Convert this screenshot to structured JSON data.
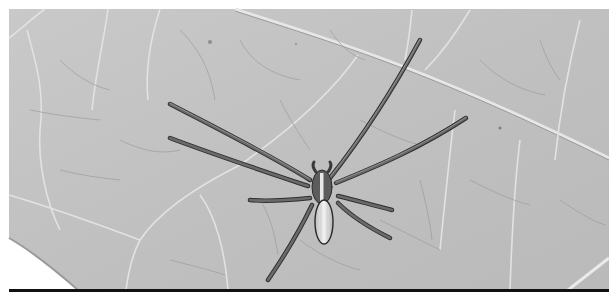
{
  "image": {
    "subject": "spider on a leaf",
    "style": "grayscale photograph",
    "description": "Long-legged spider with striped abdomen resting on the underside of a veined leaf"
  },
  "colors": {
    "background": "#ffffff",
    "leaf": "#c4c4c4",
    "leaf_dark": "#9e9e9e",
    "vein_light": "#e4e4e4",
    "vein_dark": "#8a8a8a",
    "spider_leg": "#5a5a5a",
    "spider_leg_dark": "#2a2a2a",
    "abdomen": "#e8e8e8",
    "bottom_bar": "#111111"
  }
}
